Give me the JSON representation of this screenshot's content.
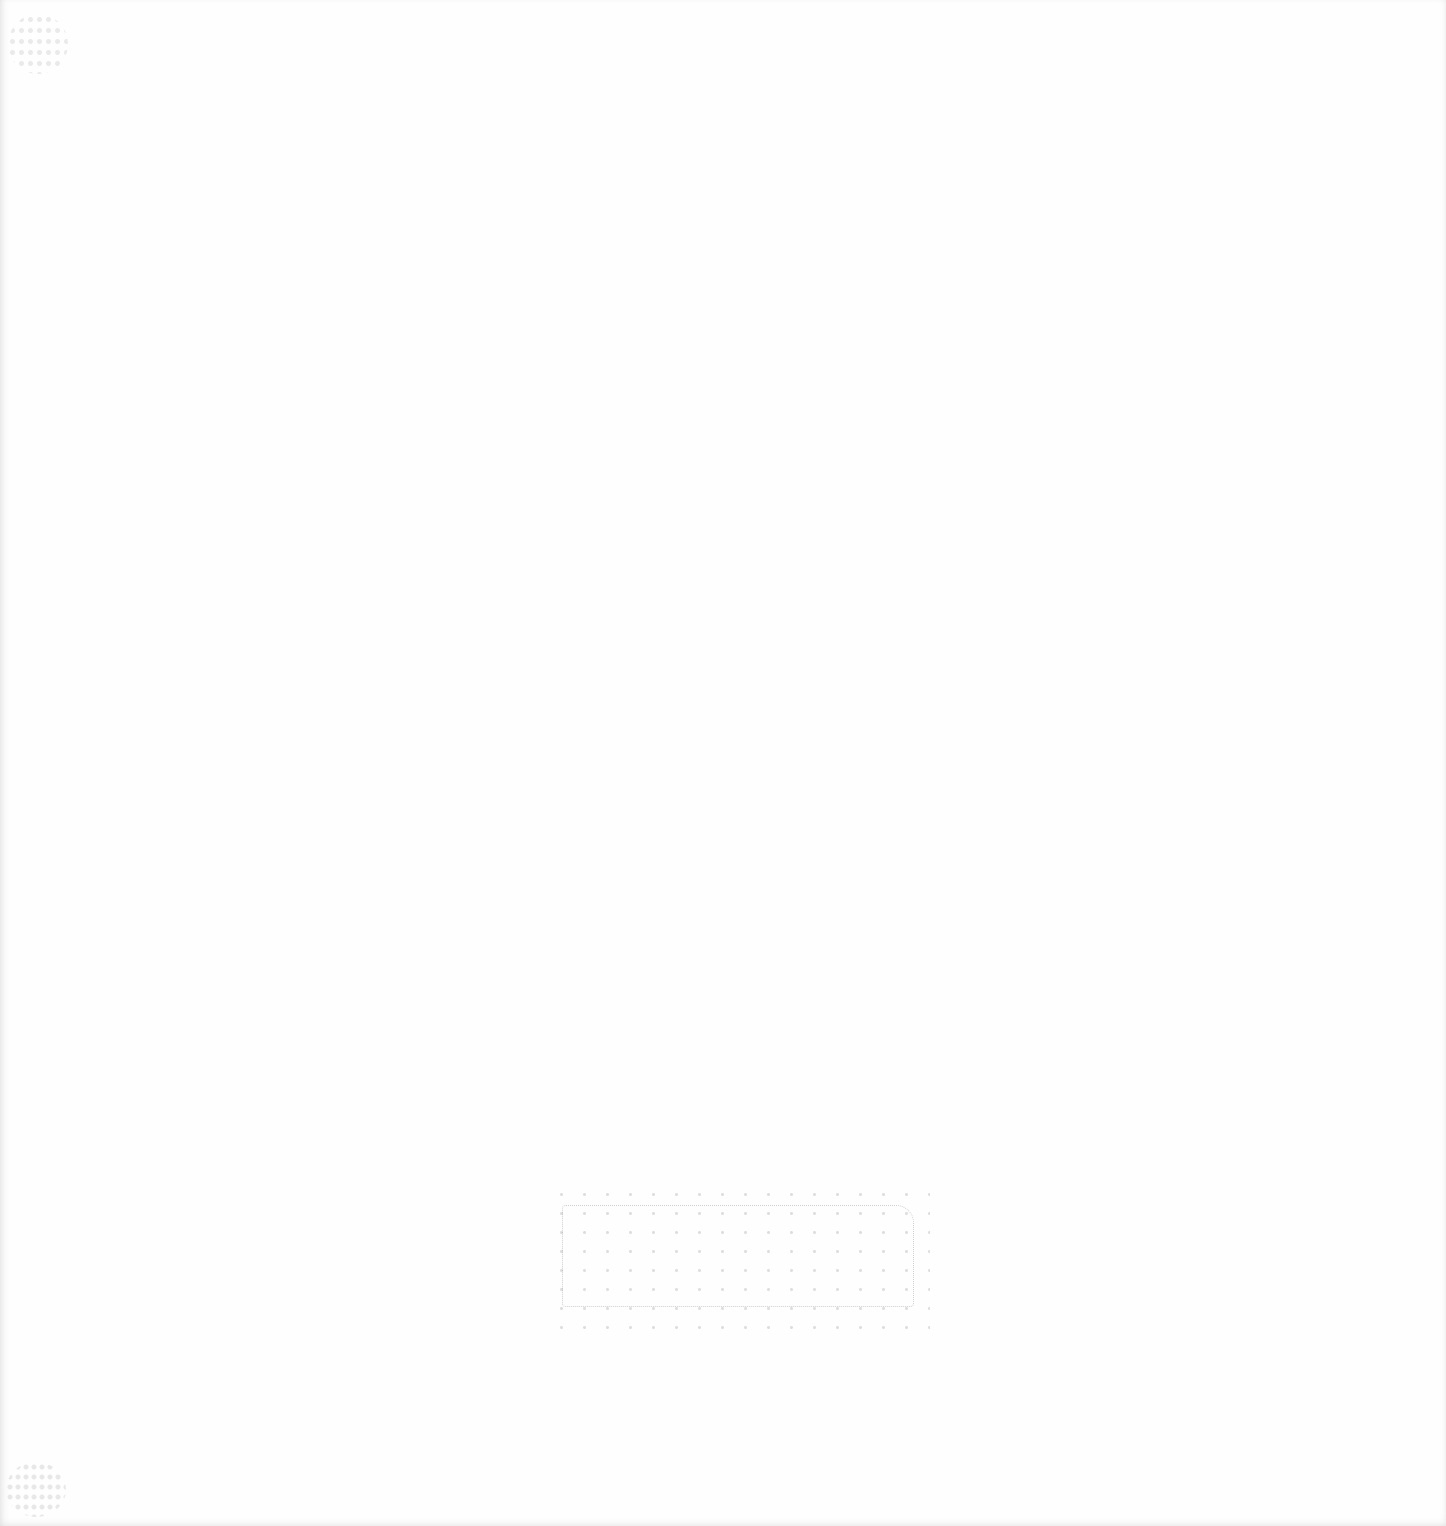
{
  "document": {
    "type": "scanned-page",
    "background": "#fefefe",
    "content": "",
    "marks": [
      {
        "name": "faded-stamp",
        "text": ""
      },
      {
        "name": "corner-noise-top-left",
        "text": ""
      },
      {
        "name": "corner-noise-bottom-left",
        "text": ""
      }
    ]
  }
}
